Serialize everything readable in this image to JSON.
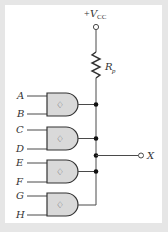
{
  "figure": {
    "type": "wired-AND (open-collector NAND gates) circuit",
    "supply": {
      "prefix": "+",
      "symbol": "V",
      "subscript": "CC"
    },
    "pullup_resistor": {
      "symbol": "R",
      "subscript": "p"
    },
    "gates": [
      {
        "id": "gate-1",
        "type": "NAND-open-collector",
        "inputs": [
          "A",
          "B"
        ]
      },
      {
        "id": "gate-2",
        "type": "NAND-open-collector",
        "inputs": [
          "C",
          "D"
        ]
      },
      {
        "id": "gate-3",
        "type": "NAND-open-collector",
        "inputs": [
          "E",
          "F"
        ]
      },
      {
        "id": "gate-4",
        "type": "NAND-open-collector",
        "inputs": [
          "G",
          "H"
        ]
      }
    ],
    "output": {
      "label": "X"
    },
    "gate_symbol": "♢",
    "colors": {
      "frame": "#e6e6e6",
      "background": "#ffffff",
      "gate_fill": "#d9d9d9",
      "wire": "#4a4a4a",
      "text": "#333333"
    }
  }
}
